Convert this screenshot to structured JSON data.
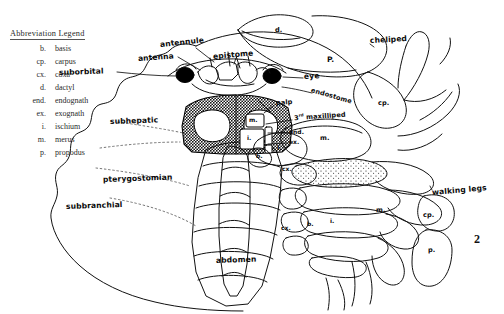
{
  "figure": {
    "number": "2",
    "background": "#ffffff",
    "ink": "#000000"
  },
  "legend": {
    "title": "Abbreviation Legend",
    "entries": [
      {
        "abbr": "b.",
        "term": "basis"
      },
      {
        "abbr": "cp.",
        "term": "carpus"
      },
      {
        "abbr": "cx.",
        "term": "coxa"
      },
      {
        "abbr": "d.",
        "term": "dactyl"
      },
      {
        "abbr": "end.",
        "term": "endognath"
      },
      {
        "abbr": "ex.",
        "term": "exognath"
      },
      {
        "abbr": "i.",
        "term": "ischium"
      },
      {
        "abbr": "m.",
        "term": "merus"
      },
      {
        "abbr": "p.",
        "term": "propodus"
      }
    ]
  },
  "labels": {
    "antennule": "antennule",
    "antenna": "antenna",
    "suborbital": "suborbital",
    "epistome": "epistome",
    "eye": "eye",
    "endostome": "endostome",
    "palp": "palp",
    "third_maxilliped_prefix": "3",
    "third_maxilliped_sup": "rd",
    "third_maxilliped_suffix": " maxilliped",
    "subhepatic": "subhepatic",
    "pterygostomian": "pterygostomian",
    "subbranchial": "subbranchial",
    "abdomen": "abdomen",
    "cheliped": "cheliped",
    "walking_legs": "walking legs"
  },
  "part_marks": {
    "dactyl_claw": "d.",
    "propodus_claw": "P.",
    "carpus_cheliped": "cp.",
    "merus_cheliped": "m.",
    "ischium_cheliped": "i.",
    "basis_cheliped": "b.",
    "coxa_cheliped": "cx.",
    "merus_maxilliped": "m.",
    "ischium_maxilliped": "i.",
    "endognath": "end.",
    "exognath": "ex.",
    "coxa_leg": "cx.",
    "basis_leg": "b.",
    "ischium_leg": "i.",
    "merus_leg": "m.",
    "carpus_leg": "cp.",
    "propodus_leg": "p."
  }
}
